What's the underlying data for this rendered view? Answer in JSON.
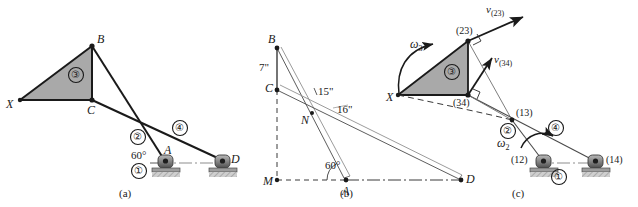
{
  "figure": {
    "panels": [
      {
        "id": "a",
        "caption": "(a)"
      },
      {
        "id": "b",
        "caption": "(b)"
      },
      {
        "id": "c",
        "caption": "(c)"
      }
    ]
  },
  "panel_a": {
    "caption": "(a)",
    "points": {
      "X": "X",
      "B": "B",
      "C": "C",
      "A": "A",
      "D": "D"
    },
    "links": {
      "link1": "①",
      "link2": "②",
      "link3": "③",
      "link4": "④"
    },
    "angle": "60°"
  },
  "panel_b": {
    "caption": "(b)",
    "points": {
      "B": "B",
      "C": "C",
      "M": "M",
      "N": "N",
      "A": "A",
      "D": "D"
    },
    "dimensions": {
      "BC": "7\"",
      "BA": "15\"",
      "CD": "16\""
    },
    "angle": "60°"
  },
  "panel_c": {
    "caption": "(c)",
    "points": {
      "X": "X",
      "p23": "(23)",
      "p34": "(34)",
      "p13": "(13)",
      "p12": "(12)",
      "p14": "(14)"
    },
    "velocities": {
      "v23_base": "v",
      "v23_sub": "(23)",
      "v34_base": "v",
      "v34_sub": "(34)"
    },
    "omegas": {
      "w3_base": "ω",
      "w3_sub": "3",
      "w2_base": "ω",
      "w2_sub": "2"
    },
    "links": {
      "link1": "①",
      "link2": "②",
      "link3": "③",
      "link4": "④"
    }
  },
  "colors": {
    "line": "#1a1a1a",
    "thin_line": "#6b6b6b",
    "shade": "#a9a9a9",
    "support_body": "#808080",
    "support_dark": "#3d3d3d",
    "ground_hatch": "#9a9a9a",
    "text": "#1a1a1a"
  }
}
